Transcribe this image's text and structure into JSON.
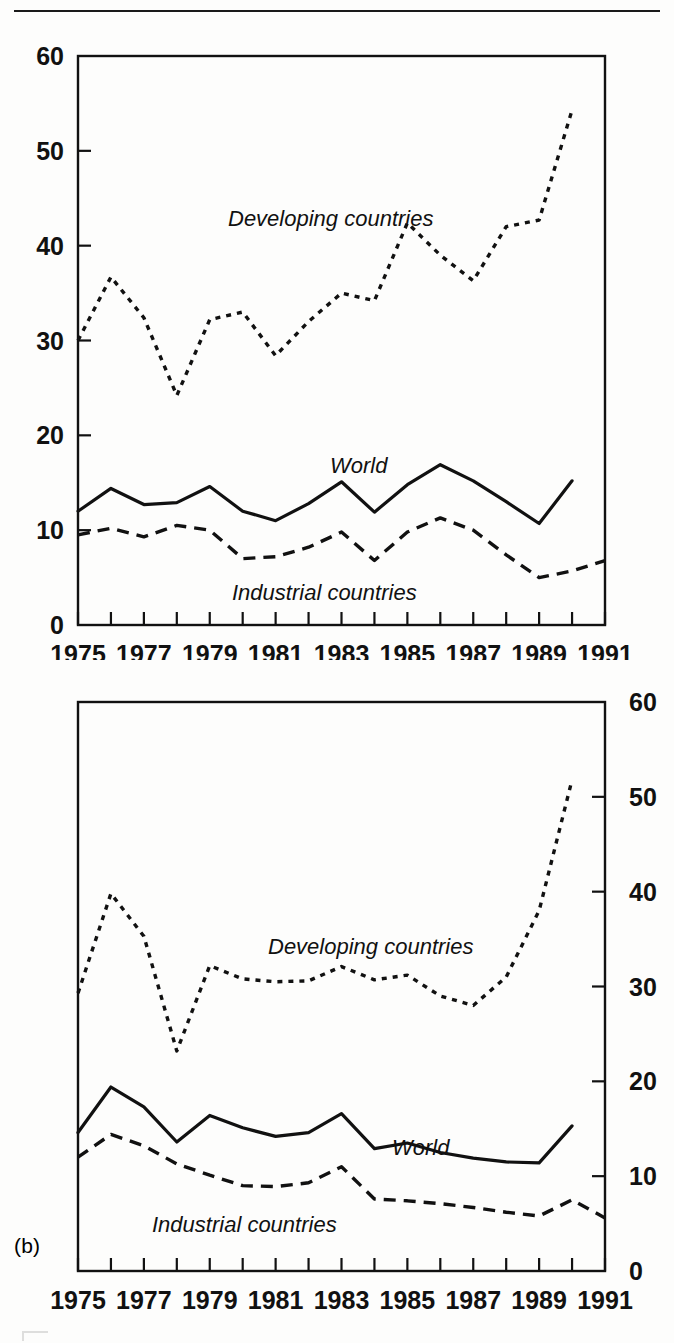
{
  "figure": {
    "panel_b_tag": "(b)"
  },
  "panel_a": {
    "name": "panel-a",
    "y_axis_side": "left",
    "y_ticks": [
      "0",
      "10",
      "20",
      "30",
      "40",
      "50",
      "60"
    ],
    "x_ticks": [
      "1975",
      "1977",
      "1979",
      "1981",
      "1983",
      "1985",
      "1987",
      "1989",
      "1991"
    ],
    "labels": {
      "developing": "Developing countries",
      "world": "World",
      "industrial": "Industrial countries"
    }
  },
  "panel_b": {
    "name": "panel-b",
    "y_axis_side": "right",
    "y_ticks": [
      "0",
      "10",
      "20",
      "30",
      "40",
      "50",
      "60"
    ],
    "x_ticks": [
      "1975",
      "1977",
      "1979",
      "1981",
      "1983",
      "1985",
      "1987",
      "1989",
      "1991"
    ],
    "labels": {
      "developing": "Developing countries",
      "world": "World",
      "industrial": "Industrial countries"
    }
  },
  "chart_data": [
    {
      "type": "line",
      "panel": "(a)",
      "title": "",
      "xlabel": "",
      "ylabel": "",
      "xlim": [
        1975,
        1991
      ],
      "ylim": [
        0,
        60
      ],
      "y_axis_position": "left",
      "grid": false,
      "legend": "inline-annotations",
      "x": [
        1975,
        1976,
        1977,
        1978,
        1979,
        1980,
        1981,
        1982,
        1983,
        1984,
        1985,
        1986,
        1987,
        1988,
        1989,
        1990,
        1991
      ],
      "series": [
        {
          "name": "Developing countries",
          "style": "dotted",
          "values": [
            30.0,
            36.7,
            32.4,
            24.2,
            32.2,
            33.0,
            28.4,
            32.0,
            35.0,
            34.2,
            42.4,
            39.0,
            36.3,
            42.0,
            42.7,
            54.3,
            null
          ]
        },
        {
          "name": "World",
          "style": "solid",
          "values": [
            12.0,
            14.4,
            12.7,
            12.9,
            14.6,
            12.0,
            11.0,
            12.8,
            15.1,
            11.9,
            14.8,
            16.9,
            15.2,
            13.0,
            10.7,
            15.2,
            null
          ]
        },
        {
          "name": "Industrial countries",
          "style": "dashed",
          "values": [
            9.5,
            10.2,
            9.3,
            10.5,
            10.0,
            7.0,
            7.2,
            8.2,
            9.8,
            6.8,
            9.8,
            11.3,
            10.0,
            7.4,
            5.0,
            5.7,
            6.8
          ]
        }
      ]
    },
    {
      "type": "line",
      "panel": "(b)",
      "title": "",
      "xlabel": "",
      "ylabel": "",
      "xlim": [
        1975,
        1991
      ],
      "ylim": [
        0,
        60
      ],
      "y_axis_position": "right",
      "grid": false,
      "legend": "inline-annotations",
      "x": [
        1975,
        1976,
        1977,
        1978,
        1979,
        1980,
        1981,
        1982,
        1983,
        1984,
        1985,
        1986,
        1987,
        1988,
        1989,
        1990,
        1991
      ],
      "series": [
        {
          "name": "Developing countries",
          "style": "dotted",
          "values": [
            29.3,
            39.8,
            35.3,
            23.2,
            32.2,
            30.8,
            30.5,
            30.6,
            32.1,
            30.7,
            31.2,
            29.0,
            28.0,
            31.0,
            38.0,
            51.8,
            null
          ]
        },
        {
          "name": "World",
          "style": "solid",
          "values": [
            14.6,
            19.4,
            17.3,
            13.6,
            16.4,
            15.1,
            14.2,
            14.6,
            16.6,
            12.9,
            13.5,
            12.5,
            11.9,
            11.5,
            11.4,
            15.3,
            null
          ]
        },
        {
          "name": "Industrial countries",
          "style": "dashed",
          "values": [
            12.0,
            14.4,
            13.2,
            11.3,
            10.1,
            9.0,
            8.9,
            9.3,
            11.0,
            7.6,
            7.4,
            7.1,
            6.7,
            6.2,
            5.8,
            7.5,
            5.6
          ]
        }
      ]
    }
  ]
}
